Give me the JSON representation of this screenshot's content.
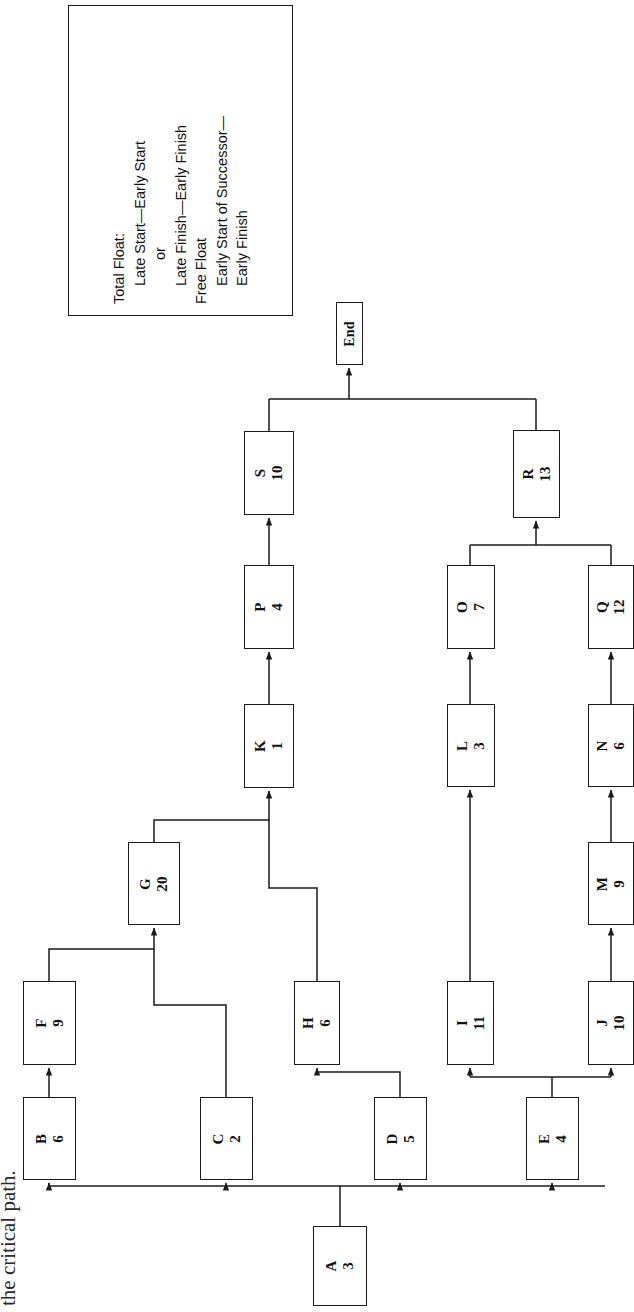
{
  "diagram": {
    "title_fragment": "the critical path.",
    "end_label": "End",
    "legend": {
      "line1": "Total Float:",
      "line2": "Late Start—Early Start",
      "line3": "or",
      "line4": "Late Finish—Early Finish",
      "line5": "Free Float",
      "line6": "Early Start of Successor—",
      "line7": "Early Finish"
    },
    "nodes": [
      {
        "id": "A",
        "duration": "3",
        "x": 313,
        "y": 1226,
        "w": 54,
        "h": 80
      },
      {
        "id": "B",
        "duration": "6",
        "x": 23,
        "y": 1097,
        "w": 53,
        "h": 83
      },
      {
        "id": "C",
        "duration": "2",
        "x": 200,
        "y": 1097,
        "w": 53,
        "h": 83
      },
      {
        "id": "D",
        "duration": "5",
        "x": 374,
        "y": 1097,
        "w": 53,
        "h": 83
      },
      {
        "id": "E",
        "duration": "4",
        "x": 526,
        "y": 1097,
        "w": 53,
        "h": 83
      },
      {
        "id": "F",
        "duration": "9",
        "x": 23,
        "y": 981,
        "w": 53,
        "h": 84
      },
      {
        "id": "G",
        "duration": "20",
        "x": 128,
        "y": 842,
        "w": 52,
        "h": 83
      },
      {
        "id": "H",
        "duration": "6",
        "x": 294,
        "y": 981,
        "w": 46,
        "h": 84
      },
      {
        "id": "I",
        "duration": "11",
        "x": 447,
        "y": 981,
        "w": 47,
        "h": 84
      },
      {
        "id": "J",
        "duration": "10",
        "x": 588,
        "y": 981,
        "w": 46,
        "h": 84
      },
      {
        "id": "K",
        "duration": "1",
        "x": 244,
        "y": 704,
        "w": 50,
        "h": 84
      },
      {
        "id": "L",
        "duration": "3",
        "x": 447,
        "y": 704,
        "w": 48,
        "h": 83
      },
      {
        "id": "M",
        "duration": "9",
        "x": 588,
        "y": 842,
        "w": 46,
        "h": 83
      },
      {
        "id": "N",
        "duration": "6",
        "x": 588,
        "y": 704,
        "w": 46,
        "h": 83
      },
      {
        "id": "O",
        "duration": "7",
        "x": 447,
        "y": 565,
        "w": 48,
        "h": 84
      },
      {
        "id": "P",
        "duration": "4",
        "x": 244,
        "y": 565,
        "w": 50,
        "h": 84
      },
      {
        "id": "Q",
        "duration": "12",
        "x": 588,
        "y": 565,
        "w": 46,
        "h": 84
      },
      {
        "id": "R",
        "duration": "13",
        "x": 513,
        "y": 430,
        "w": 47,
        "h": 88
      },
      {
        "id": "S",
        "duration": "10",
        "x": 244,
        "y": 431,
        "w": 50,
        "h": 84
      }
    ],
    "end_node": {
      "x": 336,
      "y": 302,
      "w": 27,
      "h": 63
    },
    "legend_box": {
      "x": 68,
      "y": 5,
      "w": 225,
      "h": 311
    },
    "edges": [
      {
        "from": "A",
        "to": "B"
      },
      {
        "from": "A",
        "to": "C"
      },
      {
        "from": "A",
        "to": "D"
      },
      {
        "from": "A",
        "to": "E"
      },
      {
        "from": "B",
        "to": "F"
      },
      {
        "from": "C",
        "to": "G"
      },
      {
        "from": "F",
        "to": "G"
      },
      {
        "from": "D",
        "to": "H"
      },
      {
        "from": "E",
        "to": "I"
      },
      {
        "from": "E",
        "to": "J"
      },
      {
        "from": "G",
        "to": "K"
      },
      {
        "from": "H",
        "to": "K"
      },
      {
        "from": "I",
        "to": "L"
      },
      {
        "from": "J",
        "to": "M"
      },
      {
        "from": "M",
        "to": "N"
      },
      {
        "from": "K",
        "to": "P"
      },
      {
        "from": "L",
        "to": "O"
      },
      {
        "from": "N",
        "to": "Q"
      },
      {
        "from": "P",
        "to": "S"
      },
      {
        "from": "O",
        "to": "R"
      },
      {
        "from": "Q",
        "to": "R"
      },
      {
        "from": "S",
        "to": "End"
      },
      {
        "from": "R",
        "to": "End"
      }
    ],
    "colors": {
      "line": "#1a1a1a",
      "background": "#ffffff",
      "text": "#111111"
    }
  }
}
